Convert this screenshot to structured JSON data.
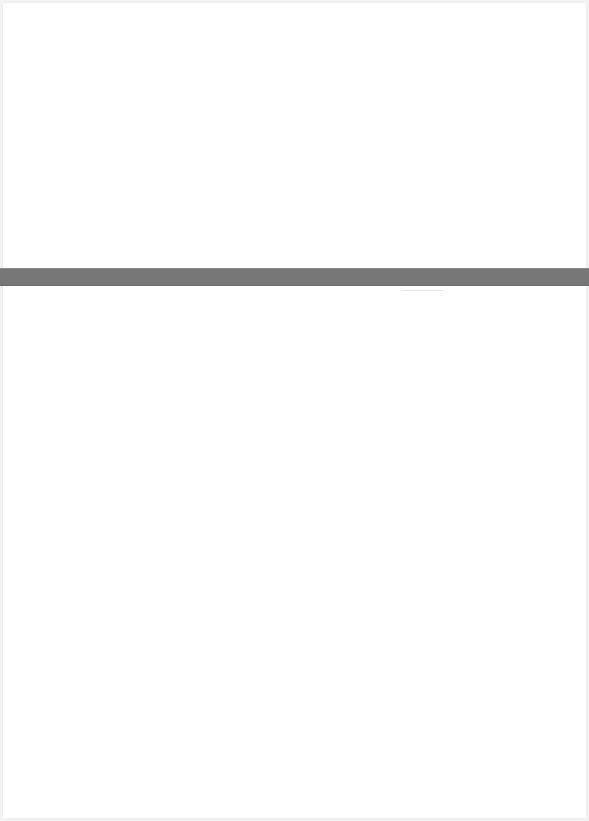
{
  "document": {
    "page_background": "#ffffff",
    "band_color": "#777777",
    "text": ""
  }
}
